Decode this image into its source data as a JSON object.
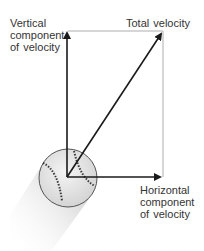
{
  "diagram": {
    "labels": {
      "vertical": [
        "Vertical",
        "component",
        "of  velocity"
      ],
      "total": "Total  velocity",
      "horizontal": [
        "Horizontal",
        "component",
        "of  velocity"
      ]
    },
    "vectors": [
      {
        "name": "vertical-component",
        "from": [
          67,
          177
        ],
        "to": [
          67,
          30
        ]
      },
      {
        "name": "horizontal-component",
        "from": [
          67,
          177
        ],
        "to": [
          163,
          177
        ]
      },
      {
        "name": "total-velocity",
        "from": [
          67,
          177
        ],
        "to": [
          163,
          31
        ]
      }
    ],
    "object": "baseball",
    "colors": {
      "arrow": "#1a1a1a",
      "guide": "#c8c8c8",
      "text": "#333333",
      "ball": "#e6e6e6",
      "stitch": "#3a3a3a"
    }
  }
}
